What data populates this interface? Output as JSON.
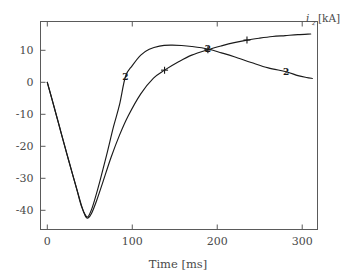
{
  "chart_data": {
    "type": "line",
    "title": "",
    "xlabel": "Time [ms]",
    "ylabel": "i_z [kA]",
    "ylabel_symbol": "i",
    "ylabel_subscript": "z",
    "ylabel_unit": "[kA]",
    "xlim": [
      -8,
      318
    ],
    "ylim": [
      -46,
      19
    ],
    "xticks": [
      0,
      100,
      200,
      300
    ],
    "xtick_labels": [
      "0",
      "100",
      "200",
      "300"
    ],
    "yticks": [
      10,
      0,
      -10,
      -20,
      -30,
      -40
    ],
    "ytick_labels": [
      "10",
      "0",
      "-10",
      "-20",
      "-30",
      "-40"
    ],
    "grid": false,
    "legend": "inline-markers",
    "series": [
      {
        "name": "1",
        "marker": "plus",
        "marker_label": "1",
        "marker_points": [
          {
            "x": 138,
            "y": 3.8
          },
          {
            "x": 189,
            "y": 10.2
          },
          {
            "x": 235,
            "y": 13.2
          }
        ],
        "x": [
          0,
          5,
          10,
          15,
          20,
          25,
          30,
          35,
          40,
          45,
          48,
          52,
          58,
          65,
          75,
          85,
          95,
          110,
          125,
          138,
          155,
          170,
          189,
          205,
          220,
          235,
          250,
          265,
          280,
          295,
          310
        ],
        "y": [
          0,
          -4.8,
          -9.7,
          -14.6,
          -19.5,
          -24.3,
          -29.0,
          -33.6,
          -38.3,
          -41.9,
          -42.4,
          -41.0,
          -37.0,
          -31.5,
          -23.5,
          -16.5,
          -10.6,
          -3.6,
          1.3,
          3.8,
          6.5,
          8.5,
          10.2,
          11.4,
          12.4,
          13.2,
          13.8,
          14.3,
          14.6,
          14.9,
          15.1
        ]
      },
      {
        "name": "2",
        "marker": "label",
        "marker_label": "2",
        "marker_points": [
          {
            "x": 92,
            "y": 1.8
          },
          {
            "x": 189,
            "y": 10.4
          },
          {
            "x": 281,
            "y": 3.3
          }
        ],
        "x": [
          0,
          5,
          10,
          15,
          20,
          25,
          30,
          35,
          40,
          45,
          48,
          52,
          56,
          62,
          70,
          78,
          85,
          92,
          100,
          110,
          120,
          132,
          145,
          158,
          170,
          189,
          205,
          220,
          240,
          260,
          281,
          295,
          305,
          312
        ],
        "y": [
          0,
          -4.8,
          -9.6,
          -14.5,
          -19.4,
          -24.2,
          -29.0,
          -33.8,
          -38.6,
          -41.6,
          -42.0,
          -39.8,
          -36.5,
          -30.8,
          -22.5,
          -13.8,
          -7.0,
          1.8,
          5.2,
          8.5,
          10.3,
          11.3,
          11.6,
          11.5,
          11.2,
          10.4,
          9.2,
          8.0,
          6.2,
          4.5,
          3.3,
          2.1,
          1.5,
          1.2
        ]
      }
    ]
  },
  "figure": {
    "background": "#ffffff",
    "axis_color": "#5a5a5a",
    "curve_color": "#1a1a1a",
    "text_color": "#4a4a4a"
  }
}
